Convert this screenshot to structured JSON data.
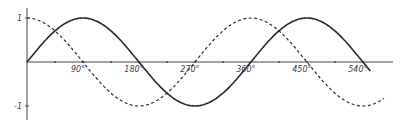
{
  "chart_data": {
    "type": "line",
    "title": "",
    "xlabel": "",
    "ylabel": "",
    "xlim": [
      0,
      560
    ],
    "ylim": [
      -1,
      1
    ],
    "grid": false,
    "legend": null,
    "x_ticks": [
      0,
      45,
      90,
      135,
      180,
      225,
      270,
      315,
      360,
      405,
      450,
      495,
      540
    ],
    "x_tick_labels": [
      {
        "value": 90,
        "label": "90°"
      },
      {
        "value": 180,
        "label": "180°"
      },
      {
        "value": 270,
        "label": "270°"
      },
      {
        "value": 360,
        "label": "360°"
      },
      {
        "value": 450,
        "label": "450°"
      },
      {
        "value": 540,
        "label": "540°"
      }
    ],
    "y_tick_labels": [
      {
        "value": 1,
        "label": "1"
      },
      {
        "value": -1,
        "label": "-1"
      }
    ],
    "series": [
      {
        "name": "sine",
        "style": "solid",
        "function": "sin(x)",
        "x_range": [
          0,
          552
        ],
        "x": [
          0,
          90,
          180,
          270,
          360,
          450,
          540
        ],
        "values": [
          0,
          1,
          0,
          -1,
          0,
          1,
          0
        ]
      },
      {
        "name": "cosine",
        "style": "dashed",
        "function": "cos(x)",
        "x_range": [
          0,
          575
        ],
        "x": [
          0,
          90,
          180,
          270,
          360,
          450,
          540
        ],
        "values": [
          1,
          0,
          -1,
          0,
          1,
          0,
          -1
        ]
      }
    ]
  },
  "colors": {
    "line": "#2a2a2a",
    "axis": "#444444",
    "background": "#ffffff"
  }
}
